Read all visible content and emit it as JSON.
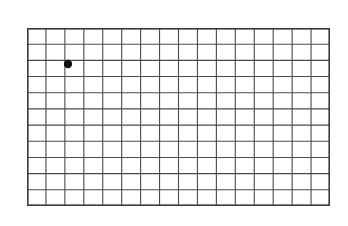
{
  "figure": {
    "title": "",
    "type": "coordinate-grid",
    "background_color": "#ffffff",
    "line_color": "#4a4a4a",
    "border_color": "#3a3a3a",
    "marker_color": "#111111"
  },
  "grid": {
    "columns": 16,
    "rows": 11,
    "left": 27,
    "top": 28,
    "width": 303,
    "height": 178,
    "cell_width": 18.9375,
    "cell_height": 16.1818
  },
  "column_labels": [
    "1",
    "2",
    "3",
    "4",
    "5",
    "6",
    "7",
    "8",
    "9",
    "10",
    "11",
    "12",
    "13",
    "14",
    "15"
  ],
  "row_labels": [
    "A",
    "B",
    "C",
    "D",
    "E",
    "F",
    "G",
    "H",
    "I",
    "J"
  ],
  "markers": [
    {
      "name": "point-marker",
      "label": "",
      "column": "3",
      "row": "C",
      "x": 68,
      "y": 64,
      "radius": 4.2
    }
  ]
}
